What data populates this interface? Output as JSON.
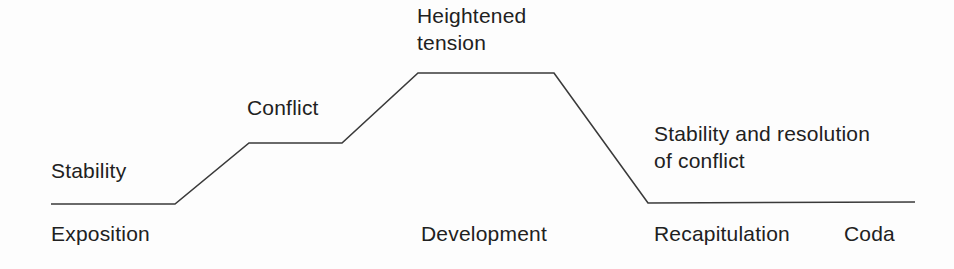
{
  "diagram": {
    "background_color": "#fdfdfd",
    "line_color": "#3a3a3a",
    "text_color": "#212121",
    "width": 954,
    "height": 269,
    "annotations": {
      "stability": "Stability",
      "conflict": "Conflict",
      "heightened_tension": "Heightened\ntension",
      "stability_resolution": "Stability and resolution\nof conflict"
    },
    "sections": {
      "exposition": "Exposition",
      "development": "Development",
      "recapitulation": "Recapitulation",
      "coda": "Coda"
    }
  },
  "chart_data": {
    "type": "line",
    "xlabel": "",
    "ylabel": "",
    "grid": false,
    "legend": "none",
    "xlim": [
      0,
      954
    ],
    "ylim": [
      0,
      269
    ],
    "series": [
      {
        "name": "tension",
        "comment": "pixel polyline of the stepped tension contour (y is screen-down)",
        "points": [
          [
            51,
            204
          ],
          [
            175,
            204
          ],
          [
            249,
            143
          ],
          [
            342,
            143
          ],
          [
            418,
            73
          ],
          [
            554,
            73
          ],
          [
            648,
            203
          ],
          [
            915,
            202
          ]
        ],
        "levels": [
          {
            "label": "Stability",
            "y": 204,
            "x_from": 51,
            "x_to": 175
          },
          {
            "label": "Conflict",
            "y": 143,
            "x_from": 249,
            "x_to": 342
          },
          {
            "label": "Heightened tension",
            "y": 73,
            "x_from": 418,
            "x_to": 554
          },
          {
            "label": "Stability and resolution of conflict",
            "y": 203,
            "x_from": 648,
            "x_to": 915
          }
        ]
      }
    ],
    "categories": [
      "Exposition",
      "Development",
      "Recapitulation",
      "Coda"
    ],
    "annotations": [
      {
        "text": "Stability",
        "x": 51,
        "y": 157
      },
      {
        "text": "Conflict",
        "x": 247,
        "y": 94
      },
      {
        "text": "Heightened tension",
        "x": 417,
        "y": 2
      },
      {
        "text": "Stability and resolution of conflict",
        "x": 654,
        "y": 120
      }
    ]
  }
}
